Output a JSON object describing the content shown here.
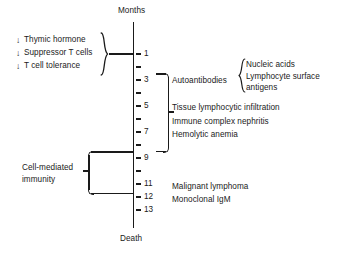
{
  "figure": {
    "axis_title": "Months",
    "axis_footer": "Death",
    "axis_start_month": 0.5,
    "axis_end_month": 13
  },
  "axis": {
    "ticks": [
      {
        "month": 1,
        "label": "1",
        "y": 54
      },
      {
        "month": 2,
        "label": "",
        "y": 67
      },
      {
        "month": 3,
        "label": "3",
        "y": 80
      },
      {
        "month": 4,
        "label": "",
        "y": 93
      },
      {
        "month": 5,
        "label": "5",
        "y": 106
      },
      {
        "month": 6,
        "label": "",
        "y": 119
      },
      {
        "month": 7,
        "label": "7",
        "y": 132
      },
      {
        "month": 8,
        "label": "",
        "y": 145
      },
      {
        "month": 9,
        "label": "9",
        "y": 158
      },
      {
        "month": 10,
        "label": "",
        "y": 171
      },
      {
        "month": 11,
        "label": "11",
        "y": 184
      },
      {
        "month": 12,
        "label": "12",
        "y": 197
      },
      {
        "month": 13,
        "label": "13",
        "y": 210
      }
    ]
  },
  "risk_factors": {
    "arrow_glyph": "↓",
    "items": [
      {
        "arrow": "↓",
        "text": "Thymic hormone",
        "y": 35
      },
      {
        "arrow": "↓",
        "text": "Suppressor T cells",
        "y": 48
      },
      {
        "arrow": "↓",
        "text": "T cell tolerance",
        "y": 61
      }
    ]
  },
  "cell_mediated": {
    "line1": "Cell-mediated",
    "line2": "immunity"
  },
  "events": [
    {
      "text": "Autoantibodies",
      "y": 76
    },
    {
      "text": "Tissue lymphocytic infiltration",
      "y": 103
    },
    {
      "text": "Immune complex nephritis",
      "y": 117
    },
    {
      "text": "Hemolytic anemia",
      "y": 130
    },
    {
      "text": "Malignant lymphoma",
      "y": 182
    },
    {
      "text": "Monoclonal IgM",
      "y": 195
    }
  ],
  "autoantibody_targets": [
    {
      "text": "Nucleic acids",
      "y": 60
    },
    {
      "text": "Lymphocyte surface",
      "y": 72
    },
    {
      "text": "antigens",
      "y": 83
    }
  ],
  "colors": {
    "ink": "#1a1a1a",
    "background": "#ffffff"
  }
}
